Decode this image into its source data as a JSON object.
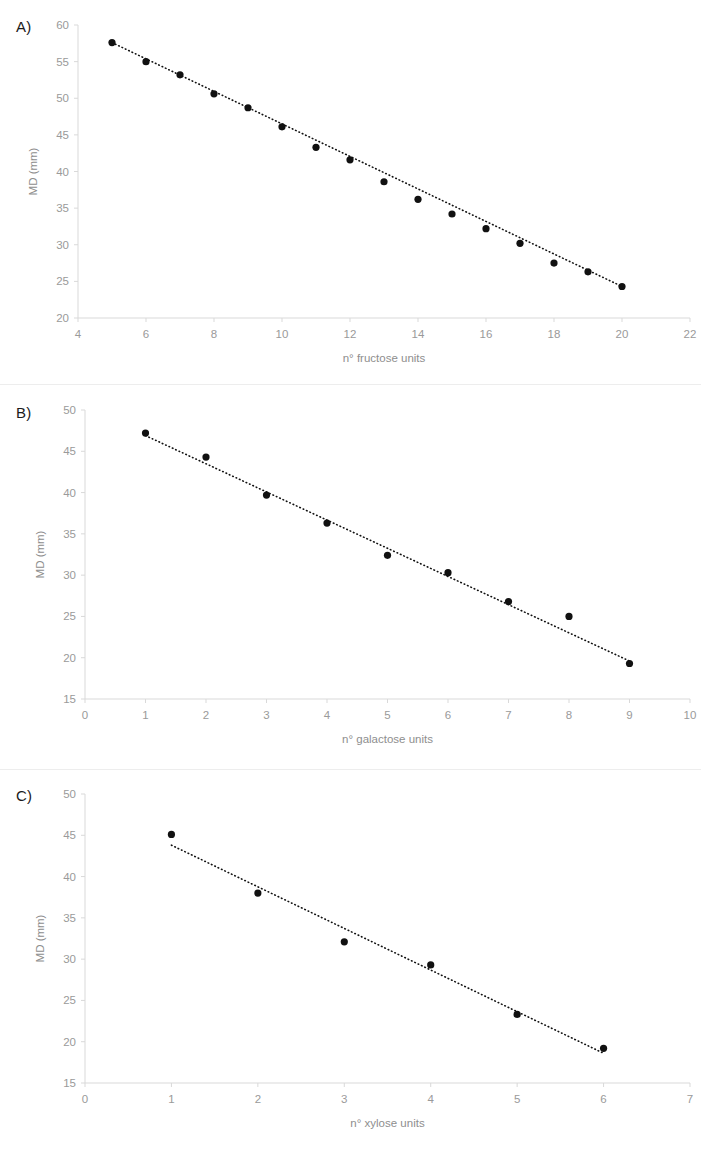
{
  "figure": {
    "panels": [
      {
        "id": "A",
        "label": "A)",
        "chart_data": {
          "type": "scatter",
          "title": "",
          "xlabel": "n° fructose units",
          "ylabel": "MD (mm)",
          "xlim": [
            4,
            22
          ],
          "ylim": [
            20,
            60
          ],
          "xticks": [
            4,
            6,
            8,
            10,
            12,
            14,
            16,
            18,
            20,
            22
          ],
          "yticks": [
            20,
            25,
            30,
            35,
            40,
            45,
            50,
            55,
            60
          ],
          "xtick_labels": [
            "4",
            "6",
            "8",
            "10",
            "12",
            "14",
            "16",
            "18",
            "20",
            "22"
          ],
          "ytick_labels": [
            "20",
            "25",
            "30",
            "35",
            "40",
            "45",
            "50",
            "55",
            "60"
          ],
          "grid": false,
          "legend": "none",
          "marker": "filled-circle",
          "trendline": {
            "style": "dotted",
            "x": [
              5,
              20
            ],
            "y": [
              57.6,
              24.3
            ]
          },
          "x": [
            5,
            6,
            7,
            8,
            9,
            10,
            11,
            12,
            13,
            14,
            15,
            16,
            17,
            18,
            19,
            20
          ],
          "y": [
            57.6,
            55.0,
            53.2,
            50.6,
            48.7,
            46.1,
            43.3,
            41.6,
            38.6,
            36.2,
            34.2,
            32.2,
            30.2,
            27.5,
            26.3,
            24.3
          ]
        }
      },
      {
        "id": "B",
        "label": "B)",
        "chart_data": {
          "type": "scatter",
          "title": "",
          "xlabel": "n° galactose units",
          "ylabel": "MD (mm)",
          "xlim": [
            0,
            10
          ],
          "ylim": [
            15,
            50
          ],
          "xticks": [
            0,
            1,
            2,
            3,
            4,
            5,
            6,
            7,
            8,
            9,
            10
          ],
          "yticks": [
            15,
            20,
            25,
            30,
            35,
            40,
            45,
            50
          ],
          "xtick_labels": [
            "0",
            "1",
            "2",
            "3",
            "4",
            "5",
            "6",
            "7",
            "8",
            "9",
            "10"
          ],
          "ytick_labels": [
            "15",
            "20",
            "25",
            "30",
            "35",
            "40",
            "45",
            "50"
          ],
          "grid": false,
          "legend": "none",
          "marker": "filled-circle",
          "trendline": {
            "style": "dotted",
            "x": [
              1,
              9
            ],
            "y": [
              46.9,
              19.6
            ]
          },
          "x": [
            1,
            2,
            3,
            4,
            5,
            6,
            7,
            8,
            9
          ],
          "y": [
            47.2,
            44.3,
            39.7,
            36.3,
            32.4,
            30.3,
            26.8,
            25.0,
            19.3
          ]
        }
      },
      {
        "id": "C",
        "label": "C)",
        "chart_data": {
          "type": "scatter",
          "title": "",
          "xlabel": "n° xylose units",
          "ylabel": "MD (mm)",
          "xlim": [
            0,
            7
          ],
          "ylim": [
            15,
            50
          ],
          "xticks": [
            0,
            1,
            2,
            3,
            4,
            5,
            6,
            7
          ],
          "yticks": [
            15,
            20,
            25,
            30,
            35,
            40,
            45,
            50
          ],
          "xtick_labels": [
            "0",
            "1",
            "2",
            "3",
            "4",
            "5",
            "6",
            "7"
          ],
          "ytick_labels": [
            "15",
            "20",
            "25",
            "30",
            "35",
            "40",
            "45",
            "50"
          ],
          "grid": false,
          "legend": "none",
          "marker": "filled-circle",
          "trendline": {
            "style": "dotted",
            "x": [
              1,
              6
            ],
            "y": [
              43.8,
              18.6
            ]
          },
          "x": [
            1,
            2,
            3,
            4,
            5,
            6
          ],
          "y": [
            45.1,
            38.0,
            32.1,
            29.3,
            23.3,
            19.2
          ]
        }
      }
    ],
    "colors": {
      "marker": "#111111",
      "trendline": "#111111",
      "axis": "#d9d9d9",
      "tick_label": "#9a9a9a",
      "panel_label": "#1b1b1b",
      "background": "#ffffff"
    }
  }
}
